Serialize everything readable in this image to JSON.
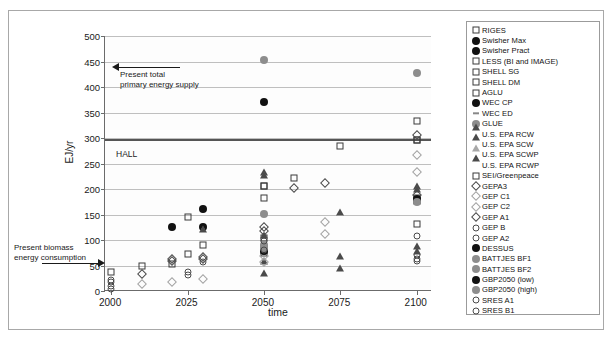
{
  "chart_data": {
    "type": "scatter",
    "title": "",
    "xlabel": "time",
    "ylabel": "EJ/yr",
    "xlim": [
      1998,
      2105
    ],
    "ylim": [
      0,
      500
    ],
    "xticks": [
      2000,
      2025,
      2050,
      2075,
      2100
    ],
    "yticks": [
      0,
      50,
      100,
      150,
      200,
      250,
      300,
      350,
      400,
      450,
      500
    ],
    "grid": "horizontal",
    "legend_position": "right-outside",
    "annotations": [
      {
        "name": "present-total-primary-energy-supply",
        "text": "Present total\nprimary energy supply",
        "value": 440,
        "arrow": "left"
      },
      {
        "name": "hall-line",
        "text": "HALL",
        "value": 298,
        "arrow": "none"
      },
      {
        "name": "present-biomass-energy-consumption",
        "text": "Present biomass\nenergy consumption",
        "value": 55,
        "arrow": "right"
      }
    ],
    "series": [
      {
        "name": "RIGES",
        "marker": "open-square",
        "points": [
          [
            2000,
            38
          ],
          [
            2010,
            50
          ],
          [
            2025,
            145
          ],
          [
            2030,
            91
          ],
          [
            2050,
            182
          ],
          [
            2050,
            205
          ],
          [
            2060,
            221
          ],
          [
            2075,
            285
          ],
          [
            2100,
            333
          ],
          [
            2100,
            178
          ],
          [
            2100,
            131
          ]
        ]
      },
      {
        "name": "Swisher Max",
        "marker": "filled-circle",
        "points": [
          [
            2020,
            126
          ],
          [
            2030,
            161
          ]
        ]
      },
      {
        "name": "Swisher Pract",
        "marker": "filled-circle",
        "points": [
          [
            2030,
            126
          ]
        ]
      },
      {
        "name": "LESS (BI and IMAGE)",
        "marker": "open-square",
        "points": [
          [
            2025,
            73
          ],
          [
            2050,
            104
          ],
          [
            2100,
            297
          ]
        ]
      },
      {
        "name": "SHELL SG",
        "marker": "open-square",
        "points": [
          [
            2050,
            79
          ],
          [
            2100,
            183
          ]
        ]
      },
      {
        "name": "SHELL DM",
        "marker": "open-square",
        "points": [
          [
            2050,
            84
          ],
          [
            2100,
            176
          ]
        ]
      },
      {
        "name": "AGLU",
        "marker": "open-square",
        "points": [
          [
            2020,
            52
          ],
          [
            2050,
            75
          ]
        ]
      },
      {
        "name": "WEC CP",
        "marker": "filled-circle",
        "points": [
          [
            2050,
            371
          ]
        ]
      },
      {
        "name": "WEC ED",
        "marker": "tick",
        "points": [
          [
            2050,
            452
          ]
        ]
      },
      {
        "name": "GLUE",
        "marker": "grey-circle",
        "points": [
          [
            2050,
            452
          ],
          [
            2050,
            151
          ],
          [
            2100,
            428
          ]
        ]
      },
      {
        "name": "U.S. EPA RCW",
        "marker": "open-triangle",
        "points": [
          [
            2030,
            108
          ],
          [
            2050,
            220
          ],
          [
            2075,
            140
          ],
          [
            2100,
            192
          ]
        ]
      },
      {
        "name": "U.S. EPA SCW",
        "marker": "open-triangle",
        "points": [
          [
            2050,
            213
          ],
          [
            2075,
            54
          ],
          [
            2100,
            74
          ]
        ]
      },
      {
        "name": "U.S. EPA SCWP",
        "marker": "open-triangle",
        "points": [
          [
            2050,
            45
          ],
          [
            2050,
            21
          ],
          [
            2075,
            31
          ],
          [
            2100,
            65
          ]
        ]
      },
      {
        "name": "U.S. EPA RCWP",
        "marker": "open-triangle",
        "points": [
          [
            2050,
            96
          ],
          [
            2100,
            186
          ]
        ]
      },
      {
        "name": "SEI/Greenpeace",
        "marker": "open-square",
        "points": [
          [
            2050,
            205
          ],
          [
            2100,
            297
          ]
        ]
      },
      {
        "name": "GEPA3",
        "marker": "open-diamond",
        "points": [
          [
            2010,
            34
          ],
          [
            2020,
            62
          ],
          [
            2030,
            66
          ],
          [
            2050,
            125
          ],
          [
            2070,
            212
          ],
          [
            2100,
            305
          ]
        ]
      },
      {
        "name": "GEP C1",
        "marker": "light-diamond",
        "points": [
          [
            2010,
            13
          ],
          [
            2020,
            17
          ],
          [
            2050,
            57
          ],
          [
            2070,
            111
          ],
          [
            2100,
            234
          ]
        ]
      },
      {
        "name": "GEP C2",
        "marker": "light-diamond",
        "points": [
          [
            2030,
            23
          ],
          [
            2050,
            68
          ],
          [
            2070,
            135
          ],
          [
            2100,
            267
          ]
        ]
      },
      {
        "name": "GEP A1",
        "marker": "open-diamond",
        "points": [
          [
            2020,
            58
          ],
          [
            2030,
            62
          ],
          [
            2050,
            118
          ],
          [
            2060,
            201
          ],
          [
            2100,
            188
          ]
        ]
      },
      {
        "name": "GEP B",
        "marker": "open-circle",
        "points": [
          [
            2025,
            31
          ],
          [
            2025,
            37
          ],
          [
            2050,
            88
          ],
          [
            2100,
            107
          ]
        ]
      },
      {
        "name": "GEP A2",
        "marker": "open-circle",
        "points": [
          [
            2000,
            17
          ],
          [
            2030,
            57
          ],
          [
            2050,
            80
          ],
          [
            2100,
            62
          ]
        ]
      },
      {
        "name": "DESSUS",
        "marker": "filled-circle",
        "points": [
          [
            2050,
            79
          ]
        ]
      },
      {
        "name": "BATTJES BF1",
        "marker": "grey-circle",
        "points": [
          [
            2050,
            84
          ]
        ]
      },
      {
        "name": "BATTJES BF2",
        "marker": "grey-circle",
        "points": [
          [
            2050,
            90
          ]
        ]
      },
      {
        "name": "GBP2050 (low)",
        "marker": "filled-circle",
        "points": [
          [
            2100,
            181
          ]
        ]
      },
      {
        "name": "GBP2050 (high)",
        "marker": "grey-circle",
        "points": [
          [
            2100,
            174
          ]
        ]
      },
      {
        "name": "SRES A1",
        "marker": "open-circle",
        "points": [
          [
            2000,
            10
          ],
          [
            2000,
            21
          ],
          [
            2050,
            80
          ],
          [
            2100,
            70
          ]
        ]
      },
      {
        "name": "SRES B1",
        "marker": "open-circle",
        "points": [
          [
            2000,
            4
          ],
          [
            2050,
            99
          ],
          [
            2100,
            58
          ]
        ]
      }
    ]
  },
  "axes": {
    "ylabel": "EJ/yr",
    "xlabel": "time",
    "yticks": [
      "0",
      "50",
      "100",
      "150",
      "200",
      "250",
      "300",
      "350",
      "400",
      "450",
      "500"
    ],
    "xticks": [
      "2000",
      "2025",
      "2050",
      "2075",
      "2100"
    ]
  },
  "annotations": {
    "top_arrow_line1": "Present total",
    "top_arrow_line2": "primary energy supply",
    "hall": "HALL",
    "bottom_arrow_line1": "Present biomass",
    "bottom_arrow_line2": "energy consumption"
  },
  "legend": {
    "items": [
      {
        "label": "RIGES",
        "marker": "open-square"
      },
      {
        "label": "Swisher Max",
        "marker": "filled-circle"
      },
      {
        "label": "Swisher Pract",
        "marker": "filled-circle"
      },
      {
        "label": "LESS (BI and IMAGE)",
        "marker": "open-square"
      },
      {
        "label": "SHELL SG",
        "marker": "open-square"
      },
      {
        "label": "SHELL DM",
        "marker": "open-square"
      },
      {
        "label": "AGLU",
        "marker": "open-square"
      },
      {
        "label": "WEC CP",
        "marker": "filled-circle"
      },
      {
        "label": "WEC ED",
        "marker": "tick"
      },
      {
        "label": "GLUE",
        "marker": "grey-circle"
      },
      {
        "label": "U.S. EPA RCW",
        "marker": "open-triangle"
      },
      {
        "label": "U.S. EPA SCW",
        "marker": "open-triangle"
      },
      {
        "label": "U.S. EPA SCWP",
        "marker": "light-triangle"
      },
      {
        "label": "U.S. EPA RCWP",
        "marker": "open-triangle"
      },
      {
        "label": "SEI/Greenpeace",
        "marker": "open-square"
      },
      {
        "label": "GEPA3",
        "marker": "open-diamond"
      },
      {
        "label": "GEP C1",
        "marker": "light-diamond"
      },
      {
        "label": "GEP C2",
        "marker": "light-diamond"
      },
      {
        "label": "GEP A1",
        "marker": "open-diamond"
      },
      {
        "label": "GEP B",
        "marker": "open-circle"
      },
      {
        "label": "GEP A2",
        "marker": "open-circle"
      },
      {
        "label": "DESSUS",
        "marker": "filled-circle"
      },
      {
        "label": "BATTJES BF1",
        "marker": "grey-circle"
      },
      {
        "label": "BATTJES BF2",
        "marker": "grey-circle"
      },
      {
        "label": "GBP2050 (low)",
        "marker": "filled-circle"
      },
      {
        "label": "GBP2050 (high)",
        "marker": "grey-circle"
      },
      {
        "label": "SRES  A1",
        "marker": "open-circle"
      },
      {
        "label": "SRES B1",
        "marker": "open-circle"
      }
    ]
  }
}
